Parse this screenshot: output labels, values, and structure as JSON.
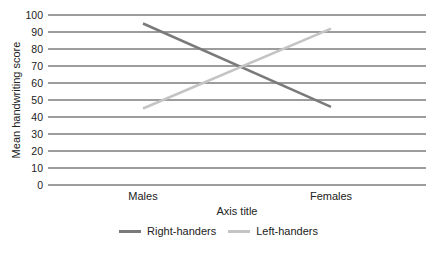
{
  "chart_data": {
    "type": "line",
    "title": "",
    "xlabel": "Axis title",
    "ylabel": "Mean handwriting score",
    "categories": [
      "Males",
      "Females"
    ],
    "series": [
      {
        "name": "Right-handers",
        "values": [
          95,
          46
        ],
        "color": "#7a7a7a"
      },
      {
        "name": "Left-handers",
        "values": [
          45,
          92
        ],
        "color": "#c4c4c4"
      }
    ],
    "ylim": [
      0,
      100
    ],
    "yticks": [
      0,
      10,
      20,
      30,
      40,
      50,
      60,
      70,
      80,
      90,
      100
    ],
    "grid": true,
    "legend_position": "bottom"
  },
  "legend": {
    "items": [
      {
        "label": "Right-handers",
        "color": "#7a7a7a"
      },
      {
        "label": "Left-handers",
        "color": "#c4c4c4"
      }
    ]
  }
}
